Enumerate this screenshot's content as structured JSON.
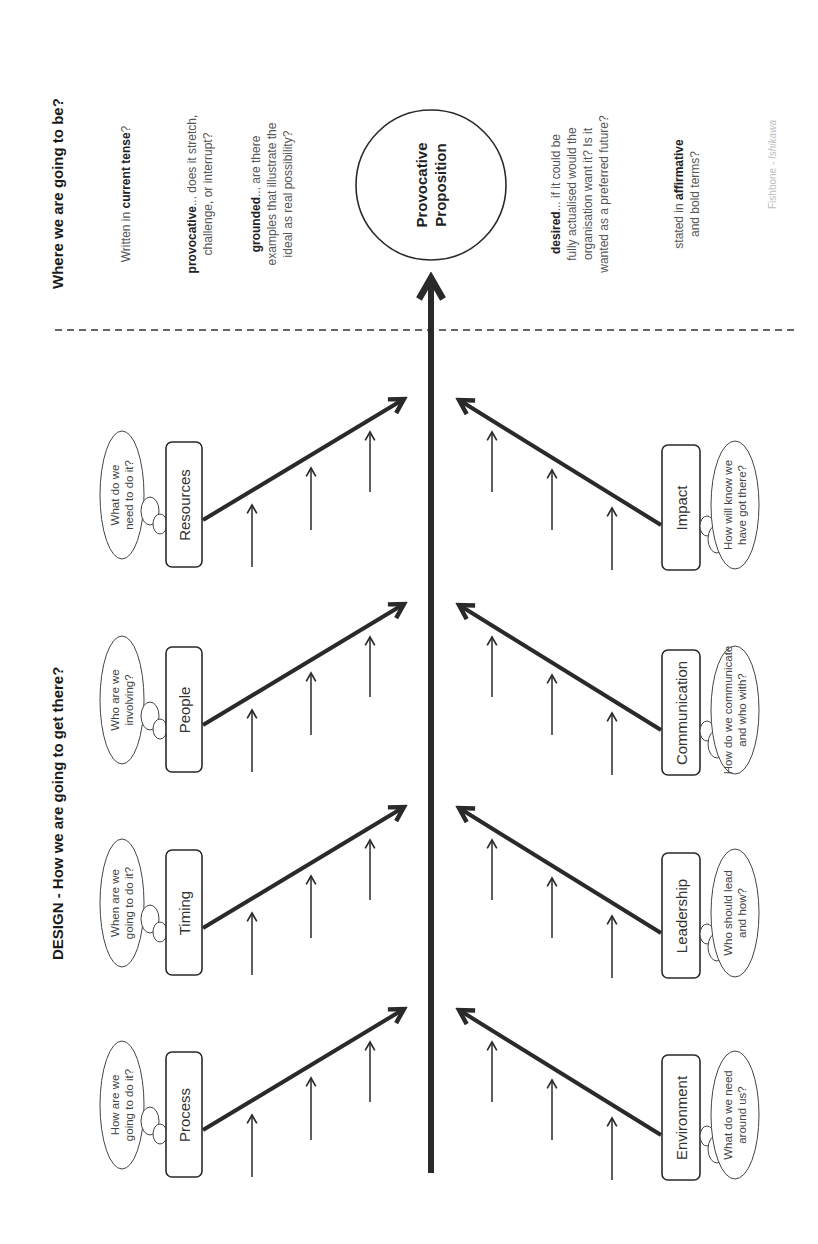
{
  "diagram": {
    "type": "fishbone",
    "credit": {
      "prefix": "Fishbone - ",
      "name": "Ishikawa"
    },
    "colors": {
      "line": "#2a2a2a",
      "text": "#555555",
      "heading": "#1a1a1a",
      "credit": "#bdbdbd"
    },
    "headings": {
      "design": "DESIGN - How we are going to get there?",
      "destiny": "Where we are going to be?"
    },
    "head": {
      "line1": "Provocative",
      "line2": "Proposition"
    },
    "criteria": [
      {
        "bold": "",
        "pre": "Written in ",
        "strong": "current tense",
        "post": "?",
        "lines": [
          "Written in current tense?"
        ]
      },
      {
        "lines": [
          "provocative... does it stretch,",
          "challenge, or interrupt?"
        ],
        "bold_word": "provocative"
      },
      {
        "lines": [
          "grounded... are there",
          "examples that illustrate the",
          "ideal as real possibility?"
        ],
        "bold_word": "grounded"
      },
      {
        "lines": [
          "desired... if it could be",
          "fully actualised would the",
          "organisation want it? Is it",
          "wanted as a preferred future?"
        ],
        "bold_word": "desired"
      },
      {
        "lines": [
          "stated in affirmative",
          "and bold terms?"
        ],
        "bold_word": "affirmative"
      }
    ],
    "criteria_text": {
      "c1_pre": "Written in ",
      "c1_bold": "current tense",
      "c1_post": "?",
      "c2_bold": "provocative",
      "c2_l1": "... does it stretch,",
      "c2_l2": "challenge, or interrupt?",
      "c3_bold": "grounded",
      "c3_l1": "... are there",
      "c3_l2": "examples that illustrate the",
      "c3_l3": "ideal as real possibility?",
      "c4_bold": "desired",
      "c4_l1": "... if it could be",
      "c4_l2": "fully actualised would the",
      "c4_l3": "organisation want it? Is it",
      "c4_l4": "wanted as a preferred future?",
      "c5_pre": "stated in ",
      "c5_bold": "affirmative",
      "c5_l2": "and bold terms?"
    },
    "top_branches": [
      {
        "label": "Process",
        "question": [
          "How are we",
          "going to do it?"
        ]
      },
      {
        "label": "Timing",
        "question": [
          "When are we",
          "going to do it?"
        ]
      },
      {
        "label": "People",
        "question": [
          "Who are we",
          "involving?"
        ]
      },
      {
        "label": "Resources",
        "question": [
          "What do we",
          "need to do it?"
        ]
      }
    ],
    "bottom_branches": [
      {
        "label": "Environment",
        "question": [
          "What do we need",
          "around us?"
        ]
      },
      {
        "label": "Leadership",
        "question": [
          "Who should lead",
          "and how?"
        ]
      },
      {
        "label": "Communication",
        "question": [
          "How do we communicate",
          "and who with?"
        ]
      },
      {
        "label": "Impact",
        "question": [
          "How will know we",
          "have got there?"
        ]
      }
    ]
  }
}
